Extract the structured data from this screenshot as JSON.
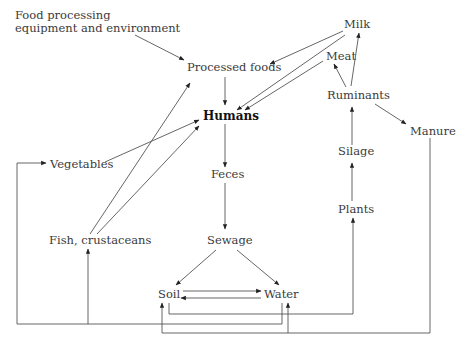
{
  "diagram": {
    "type": "flow",
    "nodes": {
      "food_processing": "Food processing",
      "food_processing_2": "equipment and environment",
      "processed_foods": "Processed foods",
      "milk": "Milk",
      "meat": "Meat",
      "ruminants": "Ruminants",
      "humans": "Humans",
      "manure": "Manure",
      "vegetables": "Vegetables",
      "silage": "Silage",
      "feces": "Feces",
      "plants": "Plants",
      "fish": "Fish, crustaceans",
      "sewage": "Sewage",
      "soil": "Soil",
      "water": "Water"
    },
    "edges": [
      {
        "from": "Food processing equipment and environment",
        "to": "Processed foods"
      },
      {
        "from": "Milk",
        "to": "Processed foods"
      },
      {
        "from": "Milk",
        "to": "Humans"
      },
      {
        "from": "Meat",
        "to": "Humans"
      },
      {
        "from": "Ruminants",
        "to": "Milk"
      },
      {
        "from": "Ruminants",
        "to": "Meat"
      },
      {
        "from": "Ruminants",
        "to": "Manure"
      },
      {
        "from": "Processed foods",
        "to": "Humans"
      },
      {
        "from": "Vegetables",
        "to": "Humans"
      },
      {
        "from": "Fish, crustaceans",
        "to": "Processed foods"
      },
      {
        "from": "Fish, crustaceans",
        "to": "Humans"
      },
      {
        "from": "Humans",
        "to": "Feces"
      },
      {
        "from": "Feces",
        "to": "Sewage"
      },
      {
        "from": "Sewage",
        "to": "Soil"
      },
      {
        "from": "Sewage",
        "to": "Water"
      },
      {
        "from": "Soil",
        "to": "Water"
      },
      {
        "from": "Water",
        "to": "Soil"
      },
      {
        "from": "Silage",
        "to": "Ruminants"
      },
      {
        "from": "Plants",
        "to": "Silage"
      },
      {
        "from": "Soil",
        "to": "Plants"
      },
      {
        "from": "Water",
        "to": "Vegetables"
      },
      {
        "from": "Water",
        "to": "Fish, crustaceans"
      },
      {
        "from": "Manure",
        "to": "Soil"
      },
      {
        "from": "Manure",
        "to": "Water"
      }
    ]
  },
  "colors": {
    "line": "#555555",
    "text": "#3a3a3a",
    "emphasis": "#111111"
  }
}
